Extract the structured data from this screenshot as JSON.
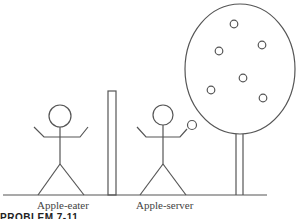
{
  "figure": {
    "labels": {
      "eater": "Apple-eater",
      "server": "Apple-server"
    },
    "caption": "PROBLEM 7-11",
    "stroke_color": "#555555",
    "apples_on_tree": 6
  }
}
